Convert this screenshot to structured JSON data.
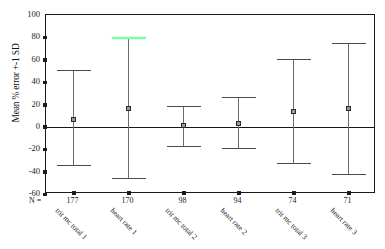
{
  "chart_data": {
    "type": "scatter",
    "title": "",
    "xlabel": "",
    "ylabel": "Mean % error +-1 SD",
    "ylim": [
      -60,
      100
    ],
    "yticks": [
      100,
      80,
      60,
      40,
      20,
      0,
      -20,
      -40,
      -60
    ],
    "grid": false,
    "legend": null,
    "n_label": "N =",
    "categories": [
      "trit mc total 1",
      "heart rate 1",
      "trit mc total 2",
      "heart rate 2",
      "trit mc total 3",
      "heart rate 3"
    ],
    "n_values": [
      177,
      170,
      98,
      94,
      74,
      71
    ],
    "series": [
      {
        "name": "Mean % error +-1 SD",
        "mean": [
          7,
          16,
          1,
          3,
          14,
          16
        ],
        "upper": [
          51,
          80,
          19,
          27,
          61,
          75
        ],
        "lower": [
          -34,
          -46,
          -17,
          -19,
          -32,
          -42
        ]
      }
    ],
    "highlight": {
      "index": 1,
      "part": "upper-cap",
      "color": "#7dfca6"
    },
    "colors": {
      "axis": "#1a1a1a",
      "bar": "#6b6b6b",
      "marker_fill": "#9a9a9a",
      "marker_edge": "#2a2a2a",
      "highlight": "#7dfca6"
    }
  }
}
